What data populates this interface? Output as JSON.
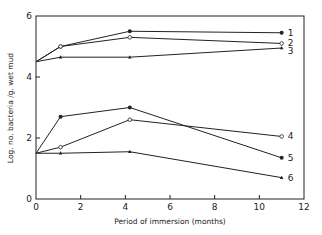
{
  "chart_data": {
    "type": "line",
    "title": "",
    "xlabel": "Period of immersion (months)",
    "ylabel": "Log. no. bacteria /g. wet mud",
    "xlim": [
      0,
      12
    ],
    "ylim": [
      0,
      6
    ],
    "xticks": [
      0,
      2,
      4,
      6,
      8,
      10,
      12
    ],
    "yticks": [
      0,
      2,
      4,
      6
    ],
    "grid": false,
    "legend": "inline labels at line ends",
    "x": [
      0,
      1.1,
      4.2,
      11
    ],
    "series": [
      {
        "name": "1",
        "marker": "filled-circle",
        "values": [
          4.5,
          5.0,
          5.5,
          5.45
        ]
      },
      {
        "name": "2",
        "marker": "open-circle",
        "values": [
          4.5,
          5.0,
          5.3,
          5.1
        ]
      },
      {
        "name": "3",
        "marker": "filled-triangle",
        "values": [
          4.5,
          4.65,
          4.65,
          4.95
        ]
      },
      {
        "name": "4",
        "marker": "open-circle",
        "values": [
          1.5,
          1.7,
          2.6,
          2.05
        ]
      },
      {
        "name": "5",
        "marker": "filled-circle",
        "values": [
          1.5,
          2.7,
          3.0,
          1.35
        ]
      },
      {
        "name": "6",
        "marker": "filled-triangle",
        "values": [
          1.5,
          1.5,
          1.55,
          0.7
        ]
      }
    ]
  },
  "colors": {
    "line": "#222222",
    "background": "#ffffff"
  }
}
